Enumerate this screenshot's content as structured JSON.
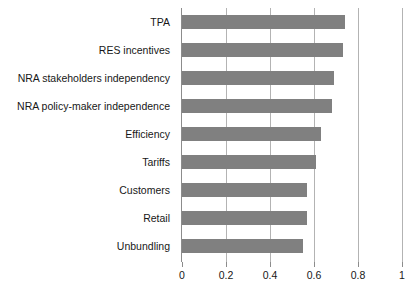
{
  "chart_data": {
    "type": "bar",
    "orientation": "horizontal",
    "title": "",
    "subtitle": "",
    "xlabel": "",
    "ylabel": "",
    "xlim": [
      0,
      1
    ],
    "ylim": null,
    "grid": "vertical",
    "legend": null,
    "legend_position": "none",
    "bar_color": "#808080",
    "axis_color": "#8c8c8c",
    "gridline_color": "#b3b3b3",
    "xticks": [
      "0",
      "0.2",
      "0.4",
      "0.6",
      "0.8",
      "1"
    ],
    "xtick_values": [
      0,
      0.2,
      0.4,
      0.6,
      0.8,
      1
    ],
    "categories": [
      "TPA",
      "RES incentives",
      "NRA stakeholders independency",
      "NRA policy-maker independence",
      "Efficiency",
      "Tariffs",
      "Customers",
      "Retail",
      "Unbundling"
    ],
    "values": [
      0.74,
      0.73,
      0.69,
      0.68,
      0.63,
      0.61,
      0.57,
      0.57,
      0.55
    ],
    "annotations": []
  }
}
